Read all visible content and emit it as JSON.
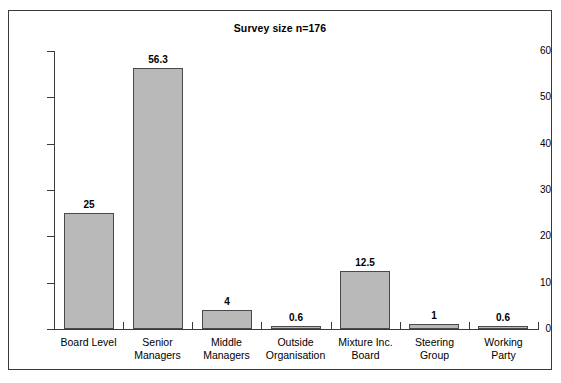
{
  "chart_data": {
    "type": "bar",
    "title": "Survey size n=176",
    "xlabel": "",
    "ylabel": "",
    "ylim": [
      0,
      60
    ],
    "ytick_step": 10,
    "yticks": [
      0,
      10,
      20,
      30,
      40,
      50,
      60
    ],
    "grid": false,
    "legend": null,
    "categories": [
      "Board Level",
      "Senior\nManagers",
      "Middle\nManagers",
      "Outside\nOrganisation",
      "Mixture Inc.\nBoard",
      "Steering\nGroup",
      "Working\nParty"
    ],
    "values": [
      25,
      56.3,
      4,
      0.6,
      12.5,
      1,
      0.6
    ],
    "value_labels": [
      "25",
      "56.3",
      "4",
      "0.6",
      "12.5",
      "1",
      "0.6"
    ],
    "bar_color": "#b9b9b9",
    "bar_edge_color": "#4a4a4a",
    "axis_color": "#3a3a3a",
    "frame_color": "#3a3a3a",
    "background": "#ffffff"
  }
}
